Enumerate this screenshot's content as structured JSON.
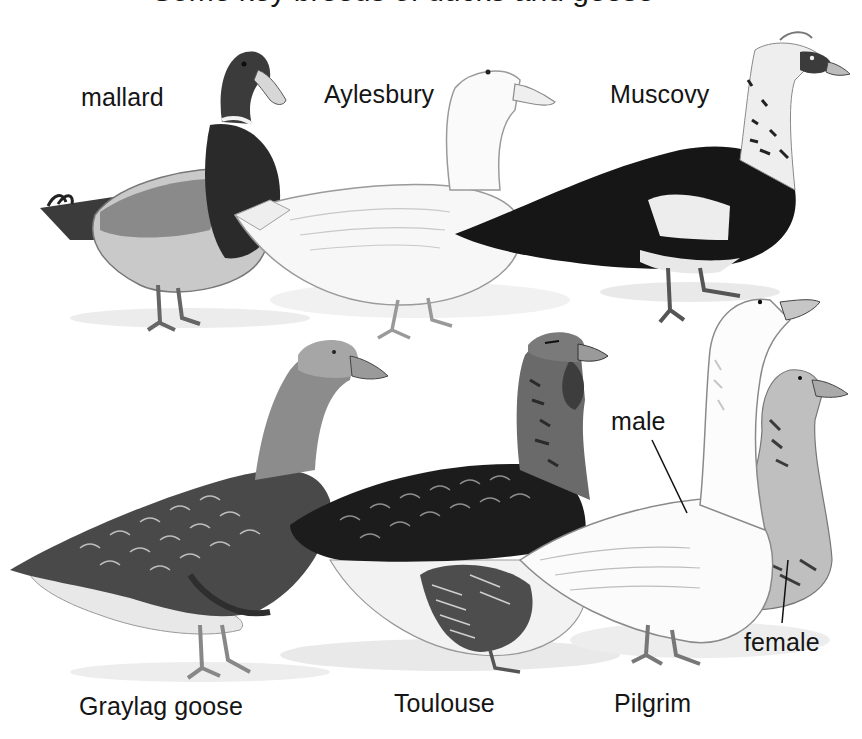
{
  "figure": {
    "title_partial": "Some key breeds of ducks and geese",
    "background": "#ffffff",
    "ink_color": "#151515"
  },
  "ducks": {
    "labels": [
      {
        "id": "mallard",
        "text": "mallard"
      },
      {
        "id": "aylesbury",
        "text": "Aylesbury"
      },
      {
        "id": "muscovy",
        "text": "Muscovy"
      }
    ]
  },
  "geese": {
    "labels": [
      {
        "id": "graylag",
        "text": "Graylag goose"
      },
      {
        "id": "toulouse",
        "text": "Toulouse"
      },
      {
        "id": "pilgrim",
        "text": "Pilgrim"
      }
    ],
    "sex_labels": [
      {
        "id": "male",
        "text": "male"
      },
      {
        "id": "female",
        "text": "female"
      }
    ]
  }
}
